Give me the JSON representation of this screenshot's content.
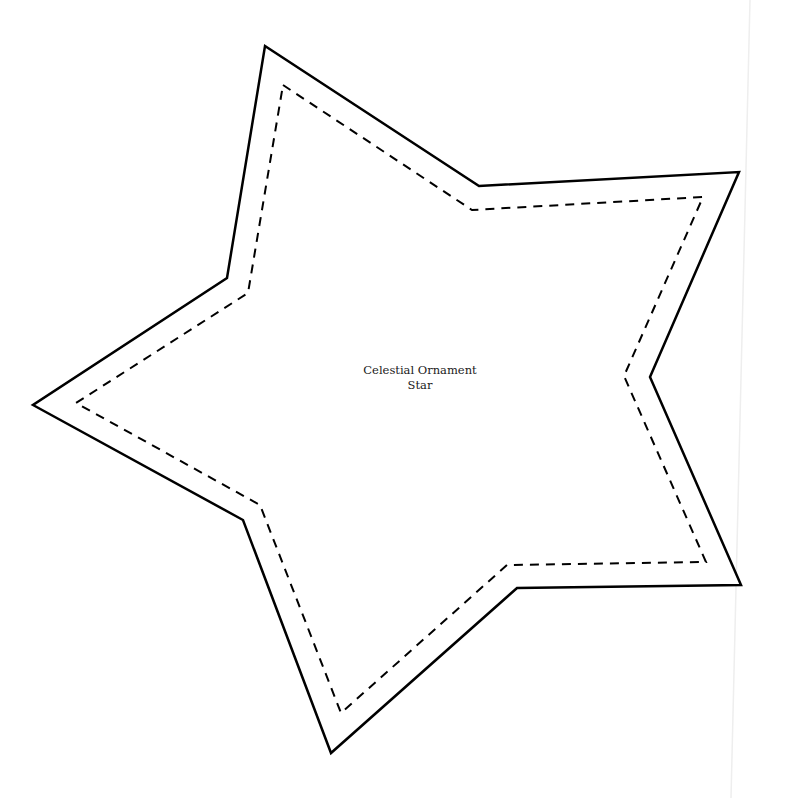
{
  "template": {
    "title_line1": "Celestial Ornament",
    "title_line2": "Star"
  },
  "shape": {
    "type": "five-point-star",
    "cut_line": {
      "style": "solid",
      "color": "#000000",
      "stroke_width": 2.5,
      "points": [
        [
          265,
          46
        ],
        [
          479,
          186
        ],
        [
          739,
          172
        ],
        [
          650,
          377
        ],
        [
          741,
          585
        ],
        [
          517,
          588
        ],
        [
          331,
          753
        ],
        [
          243,
          520
        ],
        [
          33,
          405
        ],
        [
          227,
          278
        ]
      ]
    },
    "sew_line": {
      "style": "dashed",
      "color": "#000000",
      "stroke_width": 2,
      "dash": "9,7",
      "points": [
        [
          283,
          85
        ],
        [
          472,
          210
        ],
        [
          703,
          197
        ],
        [
          624,
          376
        ],
        [
          706,
          562
        ],
        [
          507,
          565
        ],
        [
          341,
          713
        ],
        [
          260,
          505
        ],
        [
          76,
          403
        ],
        [
          248,
          293
        ]
      ]
    }
  },
  "page_edge": {
    "color": "#eeeeee",
    "from": [
      750,
      0
    ],
    "to": [
      731,
      798
    ]
  }
}
